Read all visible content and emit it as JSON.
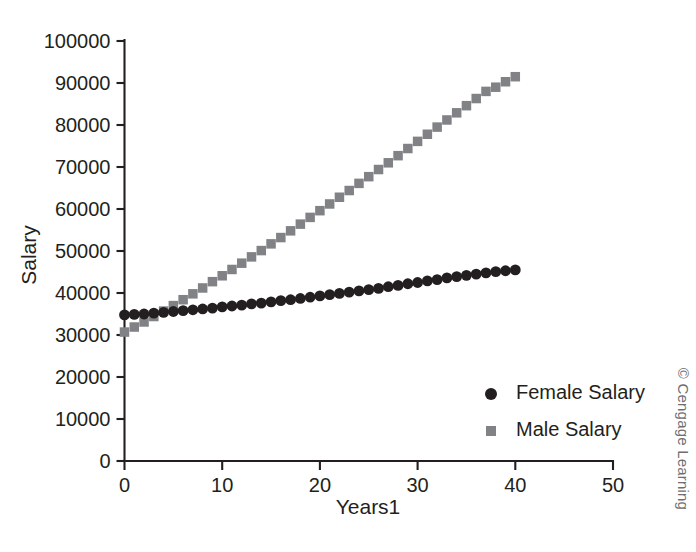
{
  "figure": {
    "credit": "© Cengage Learning"
  },
  "chart_data": {
    "type": "scatter",
    "title": "",
    "xlabel": "Years1",
    "ylabel": "Salary",
    "xlim": [
      0,
      50
    ],
    "ylim": [
      0,
      100000
    ],
    "xticks": [
      0,
      10,
      20,
      30,
      40,
      50
    ],
    "xtick_labels": [
      "0",
      "10",
      "20",
      "30",
      "40",
      "50"
    ],
    "yticks": [
      0,
      10000,
      20000,
      30000,
      40000,
      50000,
      60000,
      70000,
      80000,
      90000,
      100000
    ],
    "ytick_labels": [
      "0",
      "10000",
      "20000",
      "30000",
      "40000",
      "50000",
      "60000",
      "70000",
      "80000",
      "90000",
      "100000"
    ],
    "grid": false,
    "legend_position": "lower-right",
    "x": [
      0,
      1,
      2,
      3,
      4,
      5,
      6,
      7,
      8,
      9,
      10,
      11,
      12,
      13,
      14,
      15,
      16,
      17,
      18,
      19,
      20,
      21,
      22,
      23,
      24,
      25,
      26,
      27,
      28,
      29,
      30,
      31,
      32,
      33,
      34,
      35,
      36,
      37,
      38,
      39,
      40
    ],
    "series": [
      {
        "name": "Female Salary",
        "marker": "circle",
        "color": "#231f20",
        "values": [
          34800,
          34900,
          35000,
          35200,
          35400,
          35600,
          35800,
          36000,
          36200,
          36400,
          36700,
          36900,
          37100,
          37400,
          37600,
          37900,
          38200,
          38400,
          38700,
          39000,
          39300,
          39600,
          39900,
          40200,
          40500,
          40800,
          41100,
          41500,
          41800,
          42200,
          42500,
          42900,
          43200,
          43600,
          43900,
          44200,
          44500,
          44800,
          45100,
          45300,
          45500
        ]
      },
      {
        "name": "Male Salary",
        "marker": "square",
        "color": "#808285",
        "values": [
          30700,
          31900,
          33100,
          34400,
          35700,
          37000,
          38400,
          39800,
          41200,
          42700,
          44100,
          45600,
          47100,
          48600,
          50100,
          51700,
          53200,
          54800,
          56400,
          58000,
          59600,
          61200,
          62800,
          64400,
          66100,
          67700,
          69400,
          71000,
          72700,
          74400,
          76100,
          77800,
          79500,
          81200,
          82900,
          84600,
          86300,
          88000,
          89000,
          90300,
          91500
        ]
      }
    ],
    "legend": [
      {
        "label": "Female Salary",
        "marker": "circle",
        "color": "#231f20"
      },
      {
        "label": "Male Salary",
        "marker": "square",
        "color": "#808285"
      }
    ]
  }
}
